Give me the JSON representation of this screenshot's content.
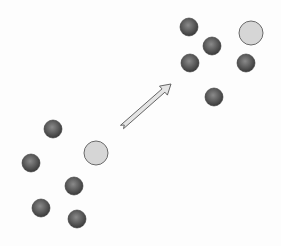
{
  "diagram": {
    "background": "#fdfdfd",
    "colors": {
      "dark_particle_center": "#8a8a8a",
      "dark_particle_edge": "#3a3a3a",
      "light_particle_fill": "#d6d6d6",
      "light_particle_stroke": "#6a6a6a",
      "arrow_fill": "#e4e4e4",
      "arrow_stroke": "#555555"
    },
    "clusters": [
      {
        "name": "lower-left-cluster",
        "dark_particles": [
          {
            "cx": 53,
            "cy": 129,
            "r": 9
          },
          {
            "cx": 31,
            "cy": 163,
            "r": 9
          },
          {
            "cx": 74,
            "cy": 186,
            "r": 9
          },
          {
            "cx": 41,
            "cy": 208,
            "r": 9
          },
          {
            "cx": 77,
            "cy": 219,
            "r": 9
          }
        ],
        "light_particle": {
          "cx": 96,
          "cy": 153,
          "r": 12
        }
      },
      {
        "name": "upper-right-cluster",
        "dark_particles": [
          {
            "cx": 189,
            "cy": 27,
            "r": 9
          },
          {
            "cx": 212,
            "cy": 46,
            "r": 9
          },
          {
            "cx": 190,
            "cy": 63,
            "r": 9
          },
          {
            "cx": 246,
            "cy": 63,
            "r": 9
          },
          {
            "cx": 214,
            "cy": 97,
            "r": 9
          }
        ],
        "light_particle": {
          "cx": 251,
          "cy": 33,
          "r": 12
        }
      }
    ],
    "arrow": {
      "x1": 122,
      "y1": 127,
      "x2": 171,
      "y2": 84
    }
  }
}
